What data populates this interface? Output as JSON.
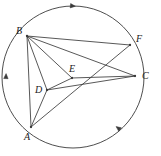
{
  "figure": {
    "kind": "circle-geometry-diagram",
    "width": 161,
    "height": 156,
    "background_color": "#ffffff",
    "stroke_color": "#3a3a3a",
    "label_color": "#1a1a1a",
    "circle": {
      "name": "circumscribed-circle",
      "center": {
        "x": 73,
        "y": 77
      },
      "radius": 71,
      "stroke_width": 0.9
    },
    "points": [
      {
        "id": "A",
        "label": "A",
        "x": 31,
        "y": 127,
        "on_circle": true,
        "label_x": 24,
        "label_y": 132
      },
      {
        "id": "B",
        "label": "B",
        "x": 27,
        "y": 36,
        "on_circle": true,
        "label_x": 16,
        "label_y": 26
      },
      {
        "id": "C",
        "label": "C",
        "x": 135,
        "y": 76,
        "on_circle": true,
        "label_x": 142,
        "label_y": 71
      },
      {
        "id": "D",
        "label": "D",
        "x": 47,
        "y": 90,
        "on_circle": false,
        "label_x": 35,
        "label_y": 85
      },
      {
        "id": "E",
        "label": "E",
        "x": 72,
        "y": 78,
        "on_circle": false,
        "label_x": 69,
        "label_y": 64
      },
      {
        "id": "F",
        "label": "F",
        "x": 130,
        "y": 45,
        "on_circle": true,
        "label_x": 136,
        "label_y": 34
      }
    ],
    "segments": [
      {
        "id": "BA",
        "from": "B",
        "to": "A",
        "label": "B to A chord"
      },
      {
        "id": "BD",
        "from": "B",
        "to": "D",
        "label": "B to D"
      },
      {
        "id": "BE",
        "from": "B",
        "to": "E",
        "label": "B to E"
      },
      {
        "id": "BC",
        "from": "B",
        "to": "C",
        "label": "B to C chord"
      },
      {
        "id": "BF",
        "from": "B",
        "to": "F",
        "label": "B to F chord"
      },
      {
        "id": "AD",
        "from": "A",
        "to": "D",
        "label": "A to D"
      },
      {
        "id": "AF",
        "from": "A",
        "to": "F",
        "label": "A through E to F chord"
      },
      {
        "id": "DE",
        "from": "D",
        "to": "E",
        "label": "D to E"
      },
      {
        "id": "DC",
        "from": "D",
        "to": "C",
        "label": "D to C"
      },
      {
        "id": "EC",
        "from": "E",
        "to": "C",
        "label": "E to C"
      }
    ],
    "arc_markers": [
      {
        "id": "arc-marker-top",
        "x": 73,
        "y": 6,
        "rotation": 6,
        "label": "arrow on arc B to F (top)"
      },
      {
        "id": "arc-marker-left",
        "x": 6,
        "y": 76,
        "rotation": -88,
        "label": "arrow on arc B to A (left)"
      },
      {
        "id": "arc-marker-bottom-right",
        "x": 118,
        "y": 128,
        "rotation": 217,
        "label": "arrow on arc A to C (bottom right)"
      }
    ]
  }
}
